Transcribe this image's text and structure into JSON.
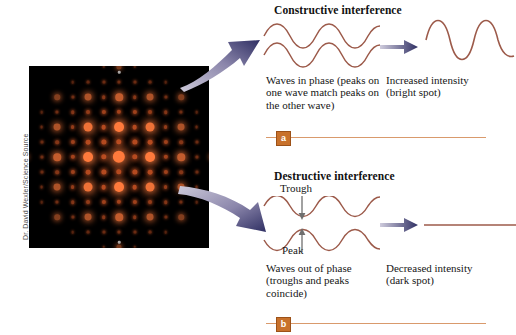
{
  "figure": {
    "credit": "Dr. David Wexler/Science Source",
    "photo_alt": "x-ray-diffraction-pattern"
  },
  "panels": [
    {
      "id": "a",
      "badge": "a",
      "heading": "Constructive interference",
      "caption_left": "Waves in phase (peaks on one wave match peaks on the other wave)",
      "caption_right": "Increased intensity (bright spot)",
      "result_type": "amplified-wave"
    },
    {
      "id": "b",
      "badge": "b",
      "heading": "Destructive interference",
      "caption_left": "Waves out of phase (troughs and peaks coincide)",
      "caption_right": "Decreased intensity (dark spot)",
      "result_type": "flat-line",
      "label_trough": "Trough",
      "label_peak": "Peak"
    }
  ],
  "colors": {
    "wave": "#9c5a4a",
    "rule": "#d99a6c",
    "badge_bg": "#c8712b",
    "arrow_dark": "#3a3a6e",
    "arrow_light": "#c9c6d8",
    "photo_bg": "#000000",
    "spot_bright": "#ff7a3c",
    "spot_dim": "#b44a20"
  },
  "chart_data": {
    "type": "line",
    "series": [
      {
        "name": "wave-1-in-phase",
        "panel": "a",
        "phase_deg": 0,
        "amplitude": 1,
        "cycles": 2.5
      },
      {
        "name": "wave-2-in-phase",
        "panel": "a",
        "phase_deg": 0,
        "amplitude": 1,
        "cycles": 2.5
      },
      {
        "name": "resultant-a",
        "panel": "a",
        "phase_deg": 0,
        "amplitude": 2,
        "cycles": 2.5
      },
      {
        "name": "wave-1-out-phase",
        "panel": "b",
        "phase_deg": 0,
        "amplitude": 1,
        "cycles": 2.5
      },
      {
        "name": "wave-2-out-phase",
        "panel": "b",
        "phase_deg": 180,
        "amplitude": 1,
        "cycles": 2.5
      },
      {
        "name": "resultant-b",
        "panel": "b",
        "phase_deg": 0,
        "amplitude": 0,
        "cycles": 0
      }
    ],
    "annotations": [
      "Trough",
      "Peak"
    ],
    "grid": false,
    "legend": "none"
  }
}
